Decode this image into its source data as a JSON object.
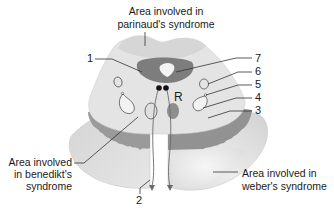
{
  "diagram": {
    "labels": {
      "parinaud_line1": "Area involved in",
      "parinaud_line2": "parinaud's syndrome",
      "benedikt_line1": "Area involved",
      "benedikt_line2": "in benedikt's",
      "benedikt_line3": "syndrome",
      "weber_line1": "Area involved in",
      "weber_line2": "weber's syndrome",
      "r_marker": "R"
    },
    "numbers": {
      "n1": "1",
      "n2": "2",
      "n3": "3",
      "n4": "4",
      "n5": "5",
      "n6": "6",
      "n7": "7"
    },
    "colors": {
      "tectum": "#d9d9d9",
      "tegmentum": "#e3e3e3",
      "peduncle": "#dcdcdc",
      "substantia_nigra": "#8c8c8c",
      "periaqueductal_gray": "#7a7a7a",
      "aqueduct": "#f2f2f2",
      "red_nucleus": "#8a8a8a",
      "outline": "#6e6e6e"
    }
  }
}
